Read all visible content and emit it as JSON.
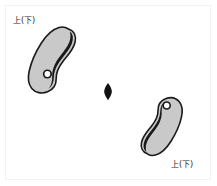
{
  "figure": {
    "background_color": "#ffffff",
    "frame_color": "#f2f2f2",
    "outline_color": "#1a1a1a",
    "fill_color": "#c9c9c9",
    "hole_fill_color": "#ffffff",
    "center_marker_color": "#111111",
    "labels": {
      "top_left": "上(下)",
      "bottom_right": "上(下)"
    },
    "objects": [
      {
        "name": "comma-bead-upper-left",
        "label": "上(下)",
        "fill": "#c9c9c9",
        "outline": "#1a1a1a",
        "perforation": "白丸",
        "orientation_deg": 0,
        "bounds": {
          "x": 28,
          "y": 26,
          "width": 48,
          "height": 68
        }
      },
      {
        "name": "center-lens-marker",
        "fill": "#111111",
        "bounds": {
          "x": 104,
          "y": 83,
          "width": 8,
          "height": 17
        }
      },
      {
        "name": "comma-bead-lower-right",
        "label": "上(下)",
        "fill": "#c9c9c9",
        "outline": "#1a1a1a",
        "perforation": "白丸",
        "orientation_deg": 180,
        "bounds": {
          "x": 143,
          "y": 97,
          "width": 48,
          "height": 60
        }
      }
    ]
  }
}
